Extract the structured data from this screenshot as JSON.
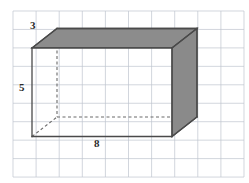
{
  "figure": {
    "kind": "rectangular-prism",
    "title": "",
    "canvas": {
      "width": 249,
      "height": 183,
      "background": "#ffffff"
    },
    "grid": {
      "visible": true,
      "color": "#bfc4cf",
      "line_width": 0.7,
      "x_origin": 13,
      "y_origin": 11,
      "x_spacing": 23.1,
      "y_spacing": 18.45,
      "x_lines": [
        13,
        36.1,
        59.2,
        82.3,
        105.4,
        128.5,
        151.6,
        174.7,
        197.8,
        220.9,
        244
      ],
      "y_lines": [
        11,
        29.45,
        47.9,
        66.35,
        84.8,
        103.25,
        121.7,
        140.15,
        158.6,
        177.05
      ]
    },
    "style": {
      "face_fill": "#8c8c8c",
      "face_fill_right": "#8a8a8a",
      "edge_color": "#4a4a4a",
      "edge_width": 1.3,
      "hidden_edge_color": "#6a6a6a",
      "hidden_edge_dash": "3 2.5",
      "label_color": "#2b2b2b"
    },
    "vertices": {
      "front_top_left": [
        32,
        47.9
      ],
      "front_top_right": [
        172,
        47.9
      ],
      "front_bottom_left": [
        32,
        136.5
      ],
      "front_bottom_right": [
        172,
        136.5
      ],
      "back_top_left": [
        57,
        28.5
      ],
      "back_top_right": [
        197,
        28.5
      ],
      "back_bottom_left": [
        57,
        117
      ],
      "back_bottom_right": [
        197,
        117
      ]
    },
    "labels": {
      "depth": "3",
      "height": "5",
      "width": "8"
    }
  }
}
